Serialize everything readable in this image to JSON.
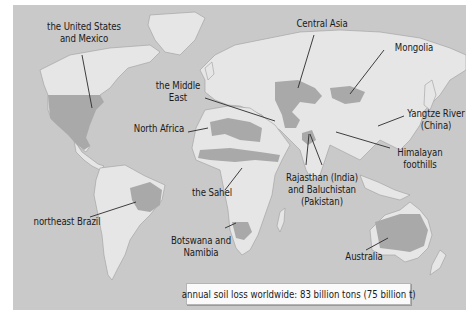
{
  "map": {
    "title": "Soil erosion hotspots world map",
    "colors": {
      "ocean": "#c9c9c9",
      "land": "#e6e6e6",
      "highlight": "#a9a9a9",
      "leader_line": "#2a2a2a"
    },
    "regions": [
      {
        "id": "usa-mexico",
        "label_lines": [
          "the United States",
          "and Mexico"
        ]
      },
      {
        "id": "central-asia",
        "label_lines": [
          "Central Asia"
        ]
      },
      {
        "id": "mongolia",
        "label_lines": [
          "Mongolia"
        ]
      },
      {
        "id": "middle-east",
        "label_lines": [
          "the Middle",
          "East"
        ]
      },
      {
        "id": "yangtze",
        "label_lines": [
          "Yangtze River",
          "(China)"
        ]
      },
      {
        "id": "north-africa",
        "label_lines": [
          "North Africa"
        ]
      },
      {
        "id": "himalayan",
        "label_lines": [
          "Himalayan",
          "foothills"
        ]
      },
      {
        "id": "rajasthan",
        "label_lines": [
          "Rajasthan (India)",
          "and Baluchistan",
          "(Pakistan)"
        ]
      },
      {
        "id": "sahel",
        "label_lines": [
          "the Sahel"
        ]
      },
      {
        "id": "ne-brazil",
        "label_lines": [
          "northeast Brazil"
        ]
      },
      {
        "id": "botswana",
        "label_lines": [
          "Botswana and",
          "Namibia"
        ]
      },
      {
        "id": "australia",
        "label_lines": [
          "Australia"
        ]
      }
    ]
  },
  "caption": {
    "text": "annual soil loss worldwide: 83 billion tons (75 billion t)"
  }
}
